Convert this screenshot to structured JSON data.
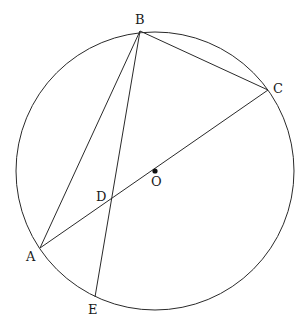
{
  "figure": {
    "type": "geometry-diagram",
    "colors": {
      "stroke": "#2a2a2a",
      "background": "#ffffff"
    },
    "circle": {
      "center": "O",
      "cx": 155,
      "cy": 171,
      "r": 139
    },
    "points": [
      {
        "id": "B",
        "label": "B",
        "x": 140,
        "y": 31,
        "label_x": 135,
        "label_y": 24
      },
      {
        "id": "C",
        "label": "C",
        "x": 268,
        "y": 90,
        "label_x": 273,
        "label_y": 93
      },
      {
        "id": "O",
        "label": "O",
        "x": 155,
        "y": 171,
        "label_x": 151,
        "label_y": 186
      },
      {
        "id": "D",
        "label": "D",
        "x": 110,
        "y": 200,
        "label_x": 96,
        "label_y": 201
      },
      {
        "id": "A",
        "label": "A",
        "x": 40,
        "y": 248,
        "label_x": 26,
        "label_y": 261
      },
      {
        "id": "E",
        "label": "E",
        "x": 95,
        "y": 297,
        "label_x": 88,
        "label_y": 314
      }
    ],
    "segments": [
      {
        "from": "A",
        "to": "C"
      },
      {
        "from": "A",
        "to": "B"
      },
      {
        "from": "B",
        "to": "C"
      },
      {
        "from": "B",
        "to": "E"
      }
    ]
  }
}
